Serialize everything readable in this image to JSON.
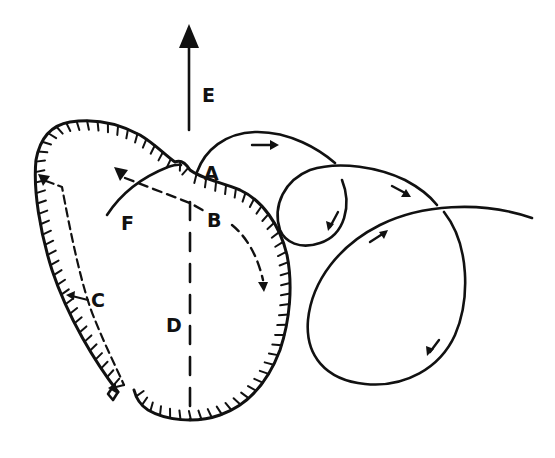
{
  "diagram": {
    "type": "line-drawing",
    "colors": {
      "ink": "#111111",
      "background": "#ffffff"
    },
    "labels": {
      "A": "A",
      "B": "B",
      "C": "C",
      "D": "D",
      "E": "E",
      "F": "F"
    },
    "elements": [
      {
        "id": "E",
        "kind": "solid arrow pointing up"
      },
      {
        "id": "contour",
        "kind": "hatched closed outline (open at lower-left)"
      },
      {
        "id": "A",
        "kind": "solid loop path start"
      },
      {
        "id": "B",
        "kind": "dashed curved arrow"
      },
      {
        "id": "C",
        "kind": "dashed arrow along left edge"
      },
      {
        "id": "D",
        "kind": "dashed vertical axis"
      },
      {
        "id": "F",
        "kind": "solid curve"
      },
      {
        "id": "loops",
        "kind": "three loops with direction arrows"
      }
    ]
  }
}
